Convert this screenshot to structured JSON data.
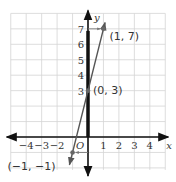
{
  "chart_data": {
    "type": "line",
    "title": "",
    "xlabel": "x",
    "ylabel": "y",
    "xlim": [
      -5,
      5
    ],
    "ylim": [
      -2,
      8
    ],
    "grid": true,
    "x_ticks": [
      -4,
      -3,
      -2,
      1,
      2,
      3,
      4
    ],
    "x_tick_labels": [
      "−4",
      "−3",
      "−2",
      "1",
      "2",
      "3",
      "4"
    ],
    "y_ticks": [
      3,
      4,
      5,
      6,
      7
    ],
    "y_tick_labels": [
      "3",
      "4",
      "5",
      "6",
      "7"
    ],
    "origin_label": "O",
    "series": [
      {
        "name": "line y = 4x + 3",
        "equation": "y = 4x + 3",
        "x": [
          -1.2,
          1.1
        ],
        "y": [
          -1.8,
          7.4
        ],
        "color": "#555555"
      }
    ],
    "points": [
      {
        "x": -1,
        "y": -1,
        "label": "(−1, −1)"
      },
      {
        "x": 0,
        "y": 3,
        "label": "(0, 3)"
      },
      {
        "x": 1,
        "y": 7,
        "label": "(1, 7)"
      }
    ],
    "highlighted_segment": {
      "x": 0,
      "from_y": 0,
      "to_y": 7,
      "color": "#111111"
    },
    "arrows": [
      {
        "from": [
          0,
          7
        ],
        "to": [
          1,
          7
        ]
      },
      {
        "from": [
          0,
          -1
        ],
        "to": [
          -1,
          -1
        ]
      }
    ]
  }
}
